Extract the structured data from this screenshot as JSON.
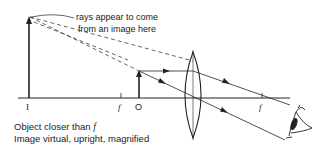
{
  "diagram": {
    "annotation": {
      "line1": "rays appear to come",
      "line2": "from an image here"
    },
    "labels": {
      "image": "I",
      "focal_left": "f",
      "object": "O",
      "focal_right": "f"
    },
    "caption": {
      "line1_prefix": "Object closer than ",
      "line1_symbol": "f",
      "line2": "Image virtual, upright, magnified"
    },
    "colors": {
      "ink": "#222222",
      "background": "#ffffff"
    }
  }
}
